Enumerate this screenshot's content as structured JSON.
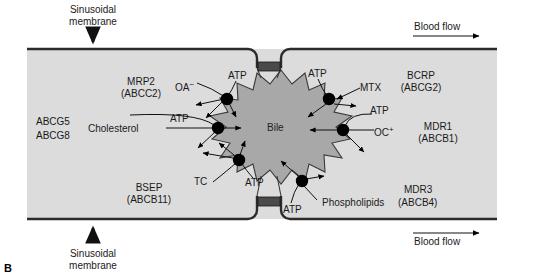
{
  "figure": {
    "panel_letter": "B",
    "bile_label": "Bile"
  },
  "annotations": {
    "sinusoidal_top": {
      "line1": "Sinusoidal",
      "line2": "membrane",
      "arrow": "down-arrow-icon"
    },
    "sinusoidal_bottom": {
      "line1": "Sinusoidal",
      "line2": "membrane",
      "arrow": "up-arrow-icon"
    },
    "blood_flow_top": {
      "label": "Blood flow",
      "arrow": "right-arrow-icon"
    },
    "blood_flow_bottom": {
      "label": "Blood flow",
      "arrow": "right-arrow-icon"
    }
  },
  "transporters": [
    {
      "id": "mrp2",
      "name": "MRP2",
      "gene": "(ABCC2)",
      "substrate": "OA",
      "substrate_charge": "−",
      "energy": "ATP"
    },
    {
      "id": "bcrp",
      "name": "BCRP",
      "gene": "(ABCG2)",
      "substrate": "MTX",
      "substrate_charge": "",
      "energy": "ATP"
    },
    {
      "id": "abcg58",
      "name": "ABCG5",
      "gene": "ABCG8",
      "substrate": "Cholesterol",
      "substrate_charge": "",
      "energy": "ATP"
    },
    {
      "id": "mdr1",
      "name": "MDR1",
      "gene": "(ABCB1)",
      "substrate": "OC",
      "substrate_charge": "+",
      "energy": "ATP"
    },
    {
      "id": "bsep",
      "name": "BSEP",
      "gene": "(ABCB11)",
      "substrate": "TC",
      "substrate_charge": "",
      "energy": "ATP"
    },
    {
      "id": "mdr3",
      "name": "MDR3",
      "gene": "(ABCB4)",
      "substrate": "Phospholipids",
      "substrate_charge": "",
      "energy": "ATP"
    }
  ],
  "colors": {
    "cytoplasm": "#dcdcdc",
    "bile_lumen": "#a8a8a8",
    "membrane_line": "#2b2b2b",
    "tight_junction": "#4a4a4a",
    "transporter_dot": "#000000",
    "text": "#1a1a1a"
  }
}
